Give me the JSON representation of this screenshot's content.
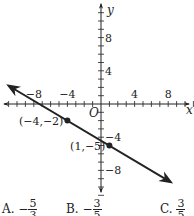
{
  "chart_data": {
    "type": "line",
    "title": "",
    "xlabel": "x",
    "ylabel": "y",
    "origin_label": "O",
    "xlim": [
      -11,
      11
    ],
    "ylim": [
      -11,
      11
    ],
    "grid": false,
    "x_tick_labels": [
      "-8",
      "-4",
      "4",
      "8"
    ],
    "y_tick_labels": [
      "8",
      "4",
      "-4",
      "-8"
    ],
    "x_tick_values": [
      -8,
      -4,
      4,
      8
    ],
    "y_tick_values": [
      8,
      4,
      -4,
      -8
    ],
    "series": [
      {
        "name": "line",
        "slope": -0.6,
        "intercept": -4.4,
        "x": [
          -11,
          8.3
        ],
        "y": [
          2.2,
          -9.4
        ],
        "arrows": "both"
      }
    ],
    "points": [
      {
        "x": -4,
        "y": -2,
        "label": "(−4,−2)"
      },
      {
        "x": 1,
        "y": -5,
        "label": "(1,−5)"
      }
    ]
  },
  "answer_choices": [
    {
      "letter": "A.",
      "sign": "−",
      "numerator": "5",
      "denominator": "3"
    },
    {
      "letter": "B.",
      "sign": "−",
      "numerator": "3",
      "denominator": "5"
    },
    {
      "letter": "C.",
      "sign": "",
      "numerator": "3",
      "denominator": "5"
    }
  ],
  "colors": {
    "ink": "#222222",
    "background": "#ffffff"
  }
}
